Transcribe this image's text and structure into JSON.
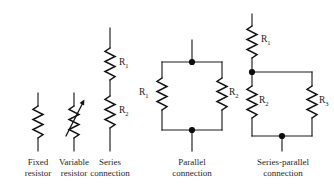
{
  "figure": {
    "type": "circuit-symbol-diagram",
    "background_color": "#ffffff",
    "line_color": "#131313",
    "text_color": "#1f1f1f"
  },
  "items": [
    {
      "id": "fixed-resistor",
      "caption_line1": "Fixed",
      "caption_line2": "resistor",
      "labels": []
    },
    {
      "id": "variable-resistor",
      "caption_line1": "Variable",
      "caption_line2": "resistor",
      "labels": []
    },
    {
      "id": "series-connection",
      "caption_line1": "Series",
      "caption_line2": "connection",
      "labels": [
        {
          "base": "R",
          "sub": "1"
        },
        {
          "base": "R",
          "sub": "2"
        }
      ]
    },
    {
      "id": "parallel-connection",
      "caption_line1": "Parallel",
      "caption_line2": "connection",
      "labels": [
        {
          "base": "R",
          "sub": "1"
        },
        {
          "base": "R",
          "sub": "2"
        }
      ]
    },
    {
      "id": "series-parallel-connection",
      "caption_line1": "Series-parallel",
      "caption_line2": "connection",
      "labels": [
        {
          "base": "R",
          "sub": "1"
        },
        {
          "base": "R",
          "sub": "2"
        },
        {
          "base": "R",
          "sub": "3"
        }
      ]
    }
  ],
  "labels": {
    "series_r1": "R",
    "series_r1_sub": "1",
    "series_r2": "R",
    "series_r2_sub": "2",
    "parallel_r1": "R",
    "parallel_r1_sub": "1",
    "parallel_r2": "R",
    "parallel_r2_sub": "2",
    "sp_r1": "R",
    "sp_r1_sub": "1",
    "sp_r2": "R",
    "sp_r2_sub": "2",
    "sp_r3": "R",
    "sp_r3_sub": "3"
  },
  "captions": {
    "fixed_l1": "Fixed",
    "fixed_l2": "resistor",
    "variable_l1": "Variable",
    "variable_l2": "resistor",
    "series_l1": "Series",
    "series_l2": "connection",
    "parallel_l1": "Parallel",
    "parallel_l2": "connection",
    "seriesparallel_l1": "Series-parallel",
    "seriesparallel_l2": "connection"
  }
}
